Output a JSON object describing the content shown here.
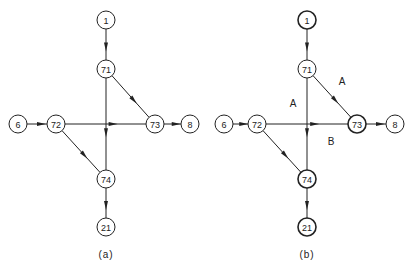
{
  "panels": [
    {
      "caption": "(a)",
      "nodes": [
        {
          "id": "1",
          "label": "1",
          "x": 106,
          "y": 20,
          "bold": false
        },
        {
          "id": "71",
          "label": "71",
          "x": 106,
          "y": 69,
          "bold": false
        },
        {
          "id": "6",
          "label": "6",
          "x": 18,
          "y": 124,
          "bold": false
        },
        {
          "id": "72",
          "label": "72",
          "x": 56,
          "y": 124,
          "bold": false
        },
        {
          "id": "73",
          "label": "73",
          "x": 155,
          "y": 124,
          "bold": false
        },
        {
          "id": "8",
          "label": "8",
          "x": 190,
          "y": 124,
          "bold": false
        },
        {
          "id": "74",
          "label": "74",
          "x": 106,
          "y": 179,
          "bold": false
        },
        {
          "id": "21",
          "label": "21",
          "x": 106,
          "y": 227,
          "bold": false
        }
      ],
      "edges": [
        {
          "from": "1",
          "to": "71"
        },
        {
          "from": "71",
          "to": "74"
        },
        {
          "from": "71",
          "to": "73"
        },
        {
          "from": "6",
          "to": "72"
        },
        {
          "from": "72",
          "to": "73"
        },
        {
          "from": "73",
          "to": "8"
        },
        {
          "from": "72",
          "to": "74"
        },
        {
          "from": "74",
          "to": "21"
        }
      ],
      "edge_labels": [],
      "caption_pos": {
        "x": 106,
        "y": 254
      }
    },
    {
      "caption": "(b)",
      "nodes": [
        {
          "id": "1",
          "label": "1",
          "x": 307,
          "y": 20,
          "bold": true
        },
        {
          "id": "71",
          "label": "71",
          "x": 307,
          "y": 69,
          "bold": false
        },
        {
          "id": "6",
          "label": "6",
          "x": 224,
          "y": 124,
          "bold": false
        },
        {
          "id": "72",
          "label": "72",
          "x": 257,
          "y": 124,
          "bold": false
        },
        {
          "id": "73",
          "label": "73",
          "x": 357,
          "y": 124,
          "bold": true
        },
        {
          "id": "8",
          "label": "8",
          "x": 395,
          "y": 124,
          "bold": false
        },
        {
          "id": "74",
          "label": "74",
          "x": 307,
          "y": 179,
          "bold": true
        },
        {
          "id": "21",
          "label": "21",
          "x": 307,
          "y": 227,
          "bold": true
        }
      ],
      "edges": [
        {
          "from": "1",
          "to": "71"
        },
        {
          "from": "71",
          "to": "74"
        },
        {
          "from": "71",
          "to": "73"
        },
        {
          "from": "6",
          "to": "72"
        },
        {
          "from": "72",
          "to": "73"
        },
        {
          "from": "73",
          "to": "8"
        },
        {
          "from": "72",
          "to": "74"
        },
        {
          "from": "74",
          "to": "21"
        }
      ],
      "edge_labels": [
        {
          "text": "A",
          "x": 293,
          "y": 103
        },
        {
          "text": "A",
          "x": 342,
          "y": 81
        },
        {
          "text": "B",
          "x": 331,
          "y": 141
        }
      ],
      "caption_pos": {
        "x": 307,
        "y": 254
      }
    }
  ],
  "style": {
    "line_color": "#222222",
    "background": "#ffffff",
    "node_radius": 9
  }
}
